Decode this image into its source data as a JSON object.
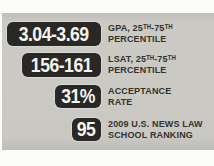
{
  "colors": {
    "page_background": "#fbfbf9",
    "panel_background": "#c9c8c3",
    "stat_box_background": "#292825",
    "stat_box_text": "#f5f4f0",
    "label_text": "#34332e"
  },
  "chart_data": {
    "type": "table",
    "rows": [
      {
        "value": "3.04-3.69",
        "label_line1": "GPA, 25ᵀᴴ-75ᵀᴴ",
        "label_line2": "PERCENTILE"
      },
      {
        "value": "156-161",
        "label_line1": "LSAT, 25ᵀᴴ-75ᵀᴴ",
        "label_line2": "PERCENTILE"
      },
      {
        "value": "31%",
        "label_line1": "ACCEPTANCE",
        "label_line2": "RATE"
      },
      {
        "value": "95",
        "label_line1": "2009 U.S. NEWS LAW",
        "label_line2": "SCHOOL RANKING"
      }
    ]
  }
}
